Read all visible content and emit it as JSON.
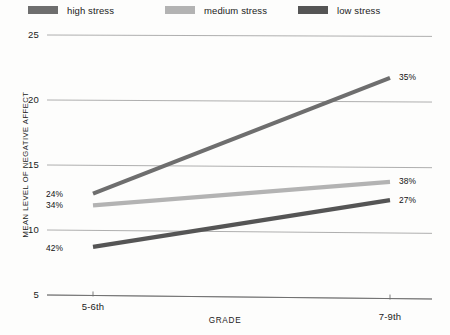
{
  "legend": {
    "position": "top",
    "items": [
      {
        "label": "high stress",
        "color": "#6e6e6e"
      },
      {
        "label": "medium stress",
        "color": "#b3b3b3"
      },
      {
        "label": "low stress",
        "color": "#555555"
      }
    ]
  },
  "axes": {
    "y_title": "MEAN LEVEL OF NEGATIVE AFFECT",
    "x_title": "GRADE",
    "y_ticks": [
      "25",
      "20",
      "15",
      "10",
      "5"
    ],
    "x_ticks": [
      "5-6th",
      "7-9th"
    ]
  },
  "annotations": [
    {
      "text": "24%"
    },
    {
      "text": "34%"
    },
    {
      "text": "42%"
    },
    {
      "text": "35%"
    },
    {
      "text": "38%"
    },
    {
      "text": "27%"
    }
  ],
  "chart_data": {
    "type": "line",
    "title": "",
    "xlabel": "GRADE",
    "ylabel": "MEAN LEVEL OF NEGATIVE AFFECT",
    "categories": [
      "5-6th",
      "7-9th"
    ],
    "ylim": [
      5,
      25
    ],
    "yticks": [
      5,
      10,
      15,
      20,
      25
    ],
    "grid": true,
    "legend_position": "top",
    "series": [
      {
        "name": "high stress",
        "color": "#6e6e6e",
        "values": [
          12.8,
          21.7
        ],
        "point_labels": [
          "24%",
          "35%"
        ]
      },
      {
        "name": "medium stress",
        "color": "#b3b3b3",
        "values": [
          11.9,
          13.7
        ],
        "point_labels": [
          "34%",
          "38%"
        ]
      },
      {
        "name": "low stress",
        "color": "#555555",
        "values": [
          8.7,
          12.3
        ],
        "point_labels": [
          "42%",
          "27%"
        ]
      }
    ]
  }
}
